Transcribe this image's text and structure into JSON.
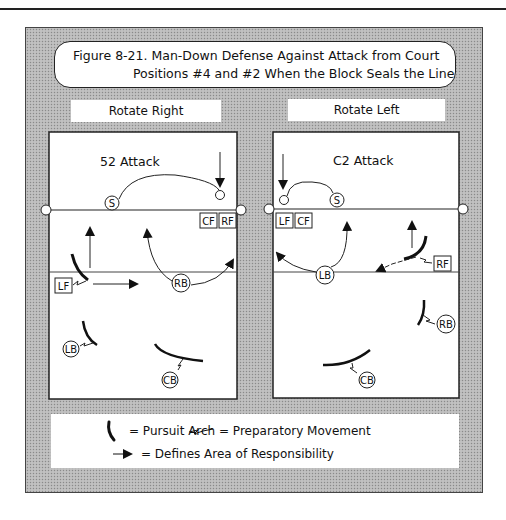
{
  "figure": {
    "title_line1": "Figure 8-21. Man-Down Defense Against Attack from Court",
    "title_line2": "Positions #4 and #2 When the Block Seals the Line"
  },
  "panels": [
    {
      "label": "Rotate Right",
      "attack_name": "52 Attack",
      "players": {
        "setter": "S",
        "front_boxes": [
          "CF",
          "RF"
        ],
        "left_front": "LF",
        "right_back": "RB",
        "left_back": "LB",
        "center_back": "CB"
      }
    },
    {
      "label": "Rotate Left",
      "attack_name": "C2 Attack",
      "players": {
        "setter": "S",
        "front_boxes": [
          "LF",
          "CF"
        ],
        "right_front": "RF",
        "left_back": "LB",
        "right_back": "RB",
        "center_back": "CB"
      }
    }
  ],
  "legend": {
    "pursuit_arch": "= Pursuit Arch",
    "preparatory_movement": "= Preparatory Movement",
    "area_of_responsibility": "= Defines Area of Responsibility"
  },
  "colors": {
    "ink": "#111111",
    "paper": "#ffffff",
    "halftone": "#b9b9b9"
  }
}
